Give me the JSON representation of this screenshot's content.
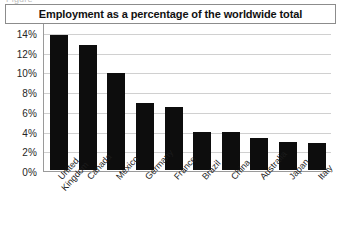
{
  "figure": {
    "caption_partial": "Figure"
  },
  "chart_data": {
    "type": "bar",
    "title": "Employment as a percentage of the worldwide total",
    "xlabel": "",
    "ylabel": "",
    "ylim": [
      0,
      16
    ],
    "yunit": "%",
    "grid": true,
    "legend": "none",
    "orientation": "vertical",
    "bar_color": "#0d0d0d",
    "categories": [
      "United Kingdom",
      "Canada",
      "Mexico",
      "Germany",
      "France",
      "Brazil",
      "China",
      "Australia",
      "Japan",
      "Italy"
    ],
    "category_lines": [
      [
        "United",
        "Kingdom"
      ],
      [
        "Canada"
      ],
      [
        "Mexico"
      ],
      [
        "Germany"
      ],
      [
        "France"
      ],
      [
        "Brazil"
      ],
      [
        "China"
      ],
      [
        "Australia"
      ],
      [
        "Japan"
      ],
      [
        "Italy"
      ]
    ],
    "values": [
      13.7,
      12.7,
      9.8,
      6.8,
      6.4,
      3.9,
      3.8,
      3.2,
      2.85,
      2.7
    ],
    "yticks": [
      16,
      14,
      12,
      10,
      8,
      6,
      4,
      2,
      0
    ],
    "ytick_labels": [
      "16%",
      "14%",
      "12%",
      "10%",
      "8%",
      "6%",
      "4%",
      "2%",
      "0%"
    ]
  }
}
